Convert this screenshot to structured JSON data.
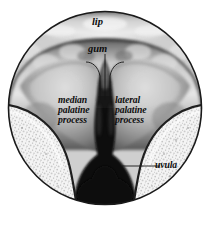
{
  "figure": {
    "type": "anatomical-illustration",
    "frame": {
      "shape": "circle",
      "center_x": 105,
      "center_y": 108,
      "radius": 97,
      "outline_color": "#1a1a1a"
    },
    "palette": {
      "background": "#ffffff",
      "outline": "#1a1a1a",
      "tissue_light": "#e8e8e8",
      "tissue_mid": "#9a9a9a",
      "tissue_dark": "#3a3a3a",
      "cleft_black": "#0a0a0a",
      "stipple_light": "#f2f2f2",
      "label_color": "#0d0d0d"
    },
    "labels": [
      {
        "id": "lip",
        "text": "lip"
      },
      {
        "id": "gum",
        "text": "gum"
      },
      {
        "id": "median_palatine_process",
        "text": "median\npalatine\nprocess"
      },
      {
        "id": "lateral_palatine_process",
        "text": "lateral\npalatine\nprocess"
      },
      {
        "id": "uvula",
        "text": "uvula"
      }
    ]
  }
}
